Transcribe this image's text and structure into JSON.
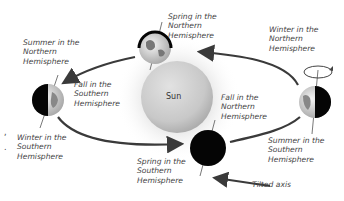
{
  "diagram": {
    "sun_label": "Sun",
    "axis_label": "Tilted axis",
    "positions": [
      {
        "id": "top",
        "lines": [
          "Spring in the",
          "Northern",
          "Hemisphere"
        ]
      },
      {
        "id": "right",
        "lines": [
          "Winter in the",
          "Northern",
          "Hemisphere"
        ]
      },
      {
        "id": "right-below",
        "lines": [
          "Summer in the",
          "Southern",
          "Hemisphere"
        ]
      },
      {
        "id": "bottom-above",
        "lines": [
          "Fall in the",
          "Northern",
          "Hemisphere"
        ]
      },
      {
        "id": "bottom-below",
        "lines": [
          "Spring in the",
          "Southern",
          "Hemisphere"
        ]
      },
      {
        "id": "left-above",
        "lines": [
          "Summer in the",
          "Northern",
          "Hemisphere"
        ]
      },
      {
        "id": "left-right",
        "lines": [
          "Fall in the",
          "Southern",
          "Hemisphere"
        ]
      },
      {
        "id": "left-below",
        "lines": [
          "Winter in the",
          "Southern",
          "Hemisphere"
        ]
      }
    ],
    "colors": {
      "orbit": "#3a3a3a",
      "sun": "#cfcfcf",
      "night": "#050505",
      "text": "#444444"
    }
  }
}
